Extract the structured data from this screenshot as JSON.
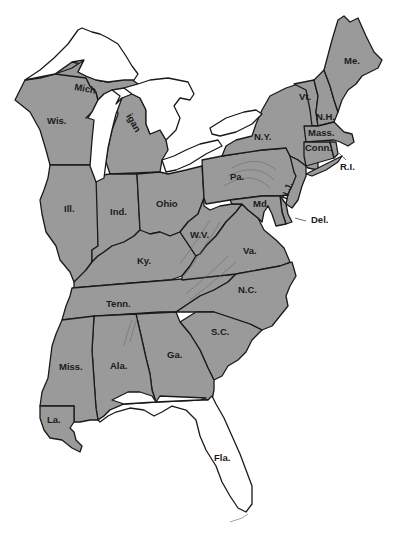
{
  "map": {
    "title": "Eastern United States",
    "colors": {
      "shaded": "#9a9a9a",
      "unshaded": "#ffffff",
      "outline": "#1a1a1a",
      "background": "#ffffff"
    },
    "lakes": [
      "Lake Superior",
      "Lake Michigan",
      "Lake Huron",
      "Lake Erie",
      "Lake Ontario"
    ],
    "states": [
      {
        "label": "Me.",
        "shaded": true
      },
      {
        "label": "Vt.",
        "shaded": true
      },
      {
        "label": "N.H.",
        "shaded": true
      },
      {
        "label": "Mass.",
        "shaded": true
      },
      {
        "label": "Conn.",
        "shaded": true
      },
      {
        "label": "R.I.",
        "shaded": true
      },
      {
        "label": "N.Y.",
        "shaded": true
      },
      {
        "label": "Pa.",
        "shaded": true
      },
      {
        "label": "N.J.",
        "shaded": true
      },
      {
        "label": "Del.",
        "shaded": true
      },
      {
        "label": "Md.",
        "shaded": true
      },
      {
        "label": "Va.",
        "shaded": true
      },
      {
        "label": "W.V.",
        "shaded": true
      },
      {
        "label": "Ohio",
        "shaded": true
      },
      {
        "label": "Mich",
        "shaded": true
      },
      {
        "label": "igan",
        "shaded": true
      },
      {
        "label": "Wis.",
        "shaded": true
      },
      {
        "label": "Ill.",
        "shaded": true
      },
      {
        "label": "Ind.",
        "shaded": true
      },
      {
        "label": "Ky.",
        "shaded": true
      },
      {
        "label": "Tenn.",
        "shaded": true
      },
      {
        "label": "N.C.",
        "shaded": true
      },
      {
        "label": "S.C.",
        "shaded": true
      },
      {
        "label": "Ga.",
        "shaded": true
      },
      {
        "label": "Ala.",
        "shaded": true
      },
      {
        "label": "Miss.",
        "shaded": true
      },
      {
        "label": "La.",
        "shaded": true
      },
      {
        "label": "Fla.",
        "shaded": false
      }
    ]
  }
}
